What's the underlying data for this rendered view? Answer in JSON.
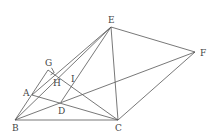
{
  "diagram": {
    "points": {
      "A": {
        "label": "A",
        "x": 32,
        "y": 95,
        "lx": 23,
        "ly": 96
      },
      "B": {
        "label": "B",
        "x": 15,
        "y": 120,
        "lx": 12,
        "ly": 131
      },
      "C": {
        "label": "C",
        "x": 118,
        "y": 120,
        "lx": 115,
        "ly": 131
      },
      "D": {
        "label": "D",
        "x": 61,
        "y": 102,
        "lx": 58,
        "ly": 114
      },
      "E": {
        "label": "E",
        "x": 111,
        "y": 27,
        "lx": 108,
        "ly": 23
      },
      "F": {
        "label": "F",
        "x": 195,
        "y": 52,
        "lx": 200,
        "ly": 56
      },
      "G": {
        "label": "G",
        "x": 48,
        "y": 70,
        "lx": 45,
        "ly": 66
      },
      "H": {
        "label": "H",
        "x": 55,
        "y": 74,
        "lx": 53,
        "ly": 86
      },
      "I": {
        "label": "I",
        "x": 72,
        "y": 86,
        "lx": 71,
        "ly": 82
      }
    },
    "segments": [
      [
        "B",
        "C"
      ],
      [
        "B",
        "E"
      ],
      [
        "B",
        "F"
      ],
      [
        "B",
        "G"
      ],
      [
        "A",
        "C"
      ],
      [
        "A",
        "E"
      ],
      [
        "E",
        "C"
      ],
      [
        "E",
        "F"
      ],
      [
        "F",
        "C"
      ],
      [
        "E",
        "D"
      ],
      [
        "G",
        "C"
      ]
    ],
    "right_angle_at": "G"
  }
}
